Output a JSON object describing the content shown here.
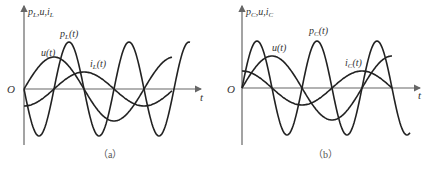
{
  "panels": [
    {
      "id": "a",
      "caption": "（a）",
      "y_axis_label": "p",
      "y_axis_label_sub": "L",
      "y_axis_label_rest": ",u,i",
      "y_axis_label_rest_sub": "L",
      "x_axis_label": "t",
      "origin_label": "O",
      "origin": [
        24,
        89
      ],
      "x_axis_end": 201,
      "y_axis_top": 6,
      "y_axis_bottom": 145,
      "curves": [
        {
          "name": "p_L(t)",
          "label": "p",
          "label_sub": "L",
          "label_rest": "(t)",
          "label_pos": [
            60,
            37
          ],
          "amp": 47,
          "period": 60,
          "phase": 180,
          "type": "sin",
          "x_end": 190
        },
        {
          "name": "u(t)",
          "label": "u(t)",
          "label_pos": [
            41,
            56
          ],
          "amp": 32,
          "period": 120,
          "phase": 0,
          "type": "sin",
          "x_end": 172
        },
        {
          "name": "i_L(t)",
          "label": "i",
          "label_sub": "L",
          "label_rest": "(t)",
          "label_pos": [
            90,
            67
          ],
          "amp": 17,
          "period": 120,
          "phase": 0,
          "type": "negcos",
          "x_end": 172
        }
      ]
    },
    {
      "id": "b",
      "caption": "（b）",
      "y_axis_label": "p",
      "y_axis_label_sub": "C",
      "y_axis_label_rest": ",u,i",
      "y_axis_label_rest_sub": "C",
      "x_axis_label": "t",
      "origin_label": "O",
      "origin": [
        242,
        88
      ],
      "x_axis_end": 420,
      "y_axis_top": 6,
      "y_axis_bottom": 145,
      "curves": [
        {
          "name": "p_C(t)",
          "label": "p",
          "label_sub": "C",
          "label_rest": "(t)",
          "label_pos": [
            309,
            34
          ],
          "amp": 47,
          "period": 60,
          "phase": 0,
          "type": "sin",
          "x_end": 410
        },
        {
          "name": "u(t)",
          "label": "u(t)",
          "label_pos": [
            272,
            51
          ],
          "amp": 32,
          "period": 120,
          "phase": 0,
          "type": "sin",
          "x_end": 392
        },
        {
          "name": "i_C(t)",
          "label": "i",
          "label_sub": "C",
          "label_rest": "(t)",
          "label_pos": [
            345,
            66
          ],
          "amp": 17,
          "period": 120,
          "phase": 0,
          "type": "cos",
          "x_end": 392
        }
      ]
    }
  ]
}
